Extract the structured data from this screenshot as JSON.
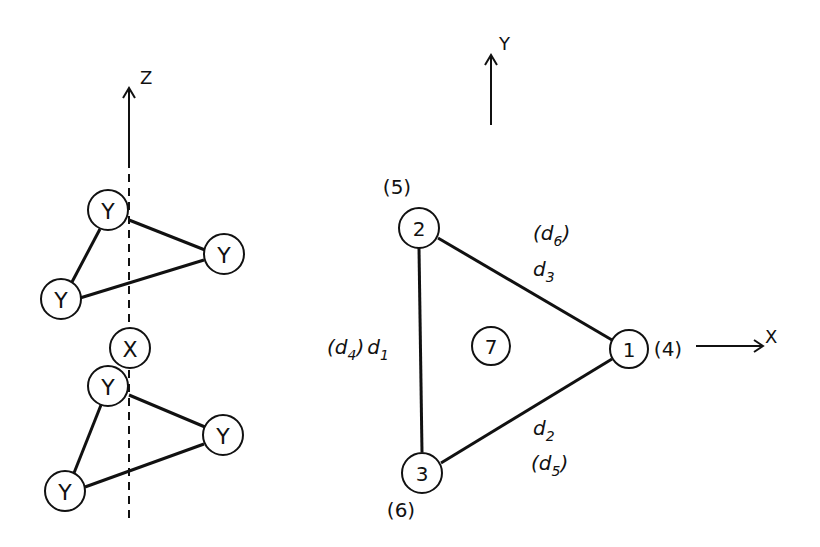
{
  "left_structure": {
    "axis": {
      "label": "Z"
    },
    "upper_triangle": {
      "atoms": [
        "Y",
        "Y",
        "Y"
      ]
    },
    "center_atom": "X",
    "lower_triangle": {
      "atoms": [
        "Y",
        "Y",
        "Y"
      ]
    }
  },
  "right_structure": {
    "axes": {
      "y_label": "Y",
      "x_label": "X"
    },
    "nodes": [
      {
        "id": "1",
        "alt": "(4)"
      },
      {
        "id": "2",
        "alt": "(5)"
      },
      {
        "id": "3",
        "alt": "(6)"
      }
    ],
    "center_node": "7",
    "edges": {
      "d1": {
        "main": "d",
        "sub": "1",
        "alt_main": "d",
        "alt_sub": "4"
      },
      "d2": {
        "main": "d",
        "sub": "2",
        "alt_main": "d",
        "alt_sub": "5"
      },
      "d3": {
        "main": "d",
        "sub": "3",
        "alt_main": "d",
        "alt_sub": "6"
      }
    }
  }
}
